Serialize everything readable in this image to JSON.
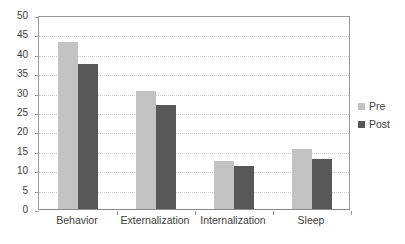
{
  "chart_data": {
    "type": "bar",
    "title": "",
    "subtitle": "",
    "xlabel": "",
    "ylabel": "",
    "categories": [
      "Behavior",
      "Externalization",
      "Internalization",
      "Sleep"
    ],
    "series": [
      {
        "name": "Pre",
        "color": "#c3c3c3",
        "values": [
          43.0,
          30.5,
          12.3,
          15.5
        ]
      },
      {
        "name": "Post",
        "color": "#585858",
        "values": [
          37.4,
          26.8,
          11.0,
          13.0
        ]
      }
    ],
    "ylim": [
      0,
      50
    ],
    "yticks": [
      0,
      5,
      10,
      15,
      20,
      25,
      30,
      35,
      40,
      45,
      50
    ],
    "ytick_labels": [
      "0",
      "5",
      "10",
      "15",
      "20",
      "25",
      "30",
      "35",
      "40",
      "45",
      "50"
    ],
    "grid": true,
    "grid_axis": "y",
    "legend": true,
    "legend_position": "right",
    "legend_entries": [
      "Pre",
      "Post"
    ],
    "plot_background": "#ffffff",
    "axis_color": "#9a9a9a",
    "gridline_color": "#cfcfcf"
  }
}
